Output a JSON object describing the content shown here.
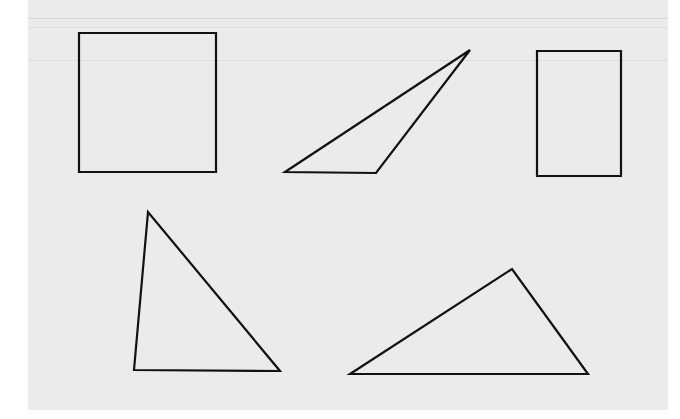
{
  "worksheet": {
    "background_color": "#ebebeb",
    "line_color": "#111111",
    "shapes": [
      {
        "name": "square",
        "type": "quadrilateral",
        "kind": "square"
      },
      {
        "name": "obtuse-triangle",
        "type": "triangle",
        "kind": "obtuse"
      },
      {
        "name": "rectangle",
        "type": "quadrilateral",
        "kind": "rectangle"
      },
      {
        "name": "acute-triangle",
        "type": "triangle",
        "kind": "acute"
      },
      {
        "name": "wide-triangle",
        "type": "triangle",
        "kind": "acute"
      }
    ]
  }
}
